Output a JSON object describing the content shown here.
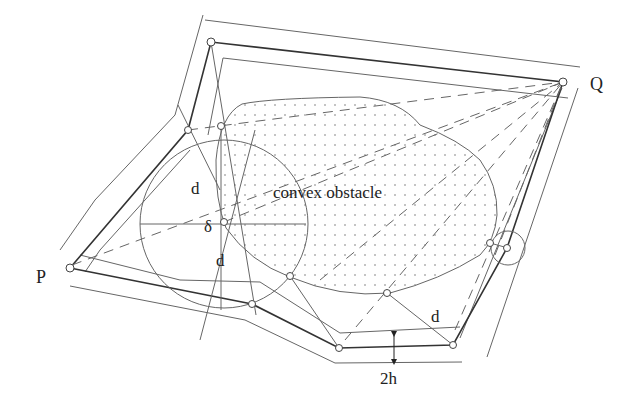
{
  "diagram": {
    "labels": {
      "P": "P",
      "Q": "Q",
      "obstacle": "convex obstacle",
      "d_upper": "d",
      "d_lower": "d",
      "d_right": "d",
      "delta": "δ",
      "two_h": "2h"
    },
    "colors": {
      "line": "#555555",
      "thick": "#333333",
      "dots": "#777777",
      "text": "#222222",
      "background": "#ffffff"
    },
    "points": {
      "P": [
        70,
        268
      ],
      "Q": [
        563,
        82
      ],
      "top_left_vertex": [
        211,
        42
      ],
      "left_vertex": [
        188,
        130
      ],
      "inner_left_vertex": [
        221,
        126
      ],
      "tangent_point": [
        224,
        222
      ],
      "lower_vertex": [
        252,
        304
      ],
      "obstacle_bottom_point": [
        290,
        276
      ],
      "bottom_left_vertex": [
        339,
        348
      ],
      "bottom_right_vertex": [
        453,
        345
      ],
      "obstacle_right_point": [
        387,
        293
      ],
      "right_vertex": [
        507,
        248
      ],
      "right_obstacle_point": [
        490,
        243
      ]
    },
    "circles": [
      {
        "name": "large-clearance-circle",
        "cx": 224,
        "cy": 224,
        "r": 84
      },
      {
        "name": "small-clearance-circle",
        "cx": 508,
        "cy": 248,
        "r": 17
      }
    ]
  }
}
